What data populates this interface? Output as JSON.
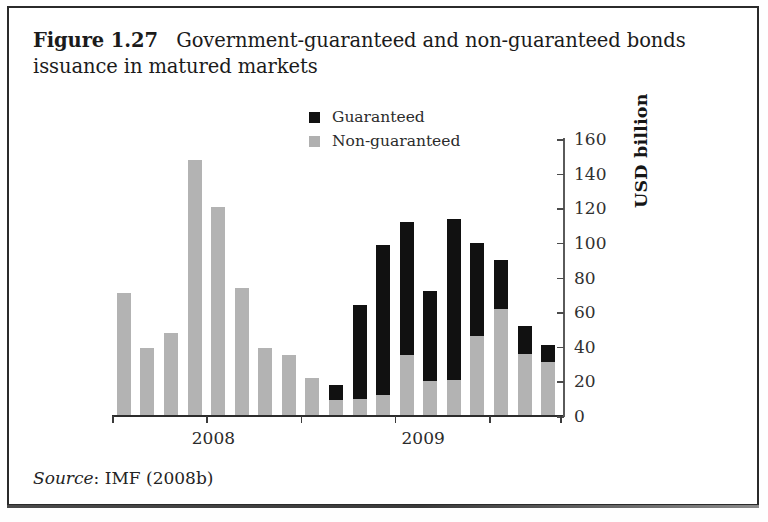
{
  "figure": {
    "label": "Figure 1.27",
    "caption": "Government-guaranteed and non-guaranteed bonds issuance in matured markets",
    "source_word": "Source",
    "source_rest": ": IMF (2008b)"
  },
  "chart_data": {
    "type": "bar",
    "stacked": true,
    "xlabel": "",
    "ylabel": "USD billion",
    "ylim": [
      0,
      160
    ],
    "yticks": [
      0,
      20,
      40,
      60,
      80,
      100,
      120,
      140,
      160
    ],
    "ytick_labels": [
      "0",
      "20",
      "40",
      "60",
      "80",
      "100",
      "120",
      "140",
      "160"
    ],
    "grid": false,
    "legend_position": "top-center",
    "axis_position": "right",
    "categories": [
      "2008-1",
      "2008-2",
      "2008-3",
      "2008-4",
      "2008-5",
      "2008-6",
      "2008-7",
      "2008-8",
      "2008-9",
      "2009-1",
      "2009-2",
      "2009-3",
      "2009-4",
      "2009-5",
      "2009-6",
      "2009-7",
      "2009-8",
      "2009-9",
      "2009-10"
    ],
    "group_labels": [
      "2008",
      "2009"
    ],
    "series": [
      {
        "name": "Non-guaranteed",
        "color": "#b3b3b3",
        "values": [
          71,
          39,
          48,
          148,
          121,
          74,
          39,
          35,
          22,
          9,
          10,
          12,
          35,
          20,
          21,
          46,
          62,
          36,
          31
        ]
      },
      {
        "name": "Guaranteed",
        "color": "#111111",
        "values": [
          0,
          0,
          0,
          0,
          0,
          0,
          0,
          0,
          0,
          9,
          54,
          87,
          77,
          52,
          93,
          54,
          28,
          16,
          10
        ]
      }
    ],
    "totals": [
      71,
      39,
      48,
      148,
      121,
      74,
      39,
      35,
      22,
      18,
      64,
      99,
      112,
      72,
      114,
      100,
      90,
      52,
      41
    ]
  },
  "legend": {
    "items": [
      {
        "label": "Guaranteed",
        "color": "#111111"
      },
      {
        "label": "Non-guaranteed",
        "color": "#b0b0b0"
      }
    ]
  }
}
